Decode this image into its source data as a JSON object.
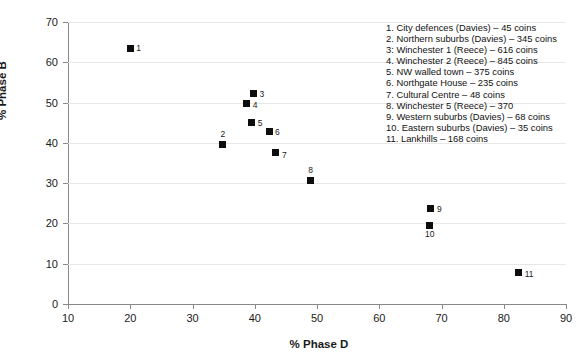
{
  "chart_data": {
    "type": "scatter",
    "title": "",
    "xlabel": "% Phase D",
    "ylabel": "% Phase B",
    "xlim": [
      10,
      90
    ],
    "ylim": [
      0,
      70
    ],
    "xticks": [
      10,
      20,
      30,
      40,
      50,
      60,
      70,
      80,
      90
    ],
    "yticks": [
      0,
      10,
      20,
      30,
      40,
      50,
      60,
      70
    ],
    "grid": "horizontal",
    "legend_position": "upper-right",
    "marker": "filled-square",
    "marker_color": "#0d0d0d",
    "points": [
      {
        "id": "1",
        "label": "1",
        "x": 20.0,
        "y": 63.5,
        "name": "City defences (Davies)",
        "coins": 45
      },
      {
        "id": "2",
        "label": "2",
        "x": 34.8,
        "y": 39.7,
        "name": "Northern suburbs (Davies)",
        "coins": 345
      },
      {
        "id": "3",
        "label": "3",
        "x": 39.8,
        "y": 52.2,
        "name": "Winchester 1 (Reece)",
        "coins": 616
      },
      {
        "id": "4",
        "label": "4",
        "x": 38.7,
        "y": 49.7,
        "name": "Winchester 2 (Reece)",
        "coins": 845
      },
      {
        "id": "5",
        "label": "5",
        "x": 39.5,
        "y": 45.0,
        "name": "NW walled town",
        "coins": 375
      },
      {
        "id": "6",
        "label": "6",
        "x": 42.3,
        "y": 42.7,
        "name": "Northgate House",
        "coins": 235
      },
      {
        "id": "7",
        "label": "7",
        "x": 43.4,
        "y": 37.7,
        "name": "Cultural Centre",
        "coins": 48
      },
      {
        "id": "8",
        "label": "8",
        "x": 48.9,
        "y": 30.7,
        "name": "Winchester 5 (Reece)",
        "coins": 370
      },
      {
        "id": "9",
        "label": "9",
        "x": 68.3,
        "y": 23.6,
        "name": "Western suburbs (Davies)",
        "coins": 68
      },
      {
        "id": "10",
        "label": "10",
        "x": 68.0,
        "y": 19.5,
        "name": "Eastern suburbs (Davies)",
        "coins": 35
      },
      {
        "id": "11",
        "label": "11",
        "x": 82.4,
        "y": 7.8,
        "name": "Lankhills",
        "coins": 168
      }
    ],
    "legend_entries": [
      "1. City defences (Davies) – 45 coins",
      "2. Northern suburbs (Davies) – 345 coins",
      "3: Winchester 1 (Reece) – 616 coins",
      "4. Winchester 2 (Reece) – 845 coins",
      "5. NW walled town – 375 coins",
      "6. Northgate House – 235 coins",
      "7. Cultural Centre – 48 coins",
      "8. Winchester 5 (Reece) – 370",
      "9. Western suburbs (Davies) – 68 coins",
      "10. Eastern suburbs (Davies) – 35 coins",
      "11. Lankhills – 168 coins"
    ]
  },
  "label_offsets": {
    "1": {
      "dx": 6,
      "dy": -4
    },
    "2": {
      "dx": -2,
      "dy": -14
    },
    "3": {
      "dx": 6,
      "dy": -4
    },
    "4": {
      "dx": 6,
      "dy": -3
    },
    "5": {
      "dx": 6,
      "dy": -4
    },
    "6": {
      "dx": 6,
      "dy": -4
    },
    "7": {
      "dx": 6,
      "dy": -1
    },
    "8": {
      "dx": -2,
      "dy": -14
    },
    "9": {
      "dx": 6,
      "dy": -4
    },
    "10": {
      "dx": -4,
      "dy": 5
    },
    "11": {
      "dx": 6,
      "dy": -3
    }
  }
}
